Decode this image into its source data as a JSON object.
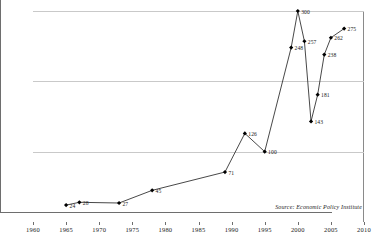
{
  "chart_data": {
    "type": "line",
    "title": "",
    "subtitle": "",
    "xlabel": "",
    "ylabel": "",
    "xlim": [
      1960,
      2010
    ],
    "ylim": [
      0,
      300
    ],
    "grid": true,
    "legend": "none",
    "marker": "filled-diamond",
    "line_color": "#333333",
    "marker_color": "#000000",
    "grid_color": "#c9c9c9",
    "axis_color": "#6e6e6e",
    "x_ticks": [
      1960,
      1965,
      1970,
      1975,
      1980,
      1985,
      1990,
      1995,
      2000,
      2005,
      2010
    ],
    "y_ticks": [
      0,
      100,
      200,
      300
    ],
    "x": [
      1965,
      1967,
      1973,
      1978,
      1989,
      1992,
      1995,
      1999,
      2000,
      2001,
      2002,
      2003,
      2004,
      2005,
      2007
    ],
    "values": [
      24,
      28,
      27,
      45,
      71,
      126,
      100,
      248,
      300,
      257,
      143,
      181,
      238,
      262,
      275
    ],
    "point_labels": [
      "24",
      "28",
      "27",
      "45",
      "71",
      "126",
      "100",
      "248",
      "300",
      "257",
      "143",
      "181",
      "238",
      "262",
      "275"
    ],
    "annotations": [
      {
        "name": "source-note",
        "text": "Source: Economic Policy Institute"
      }
    ]
  },
  "source": {
    "text": "Source: Economic Policy Institute"
  }
}
